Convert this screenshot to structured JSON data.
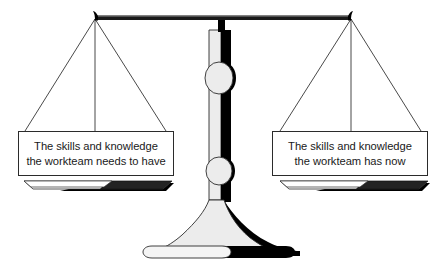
{
  "diagram": {
    "background_color": "#ffffff",
    "ink_color": "#000000",
    "shade_color": "#e8e8e8",
    "outline_color": "#2b2b2b",
    "beam_state": "balanced"
  },
  "left_pan": {
    "label_lines": [
      "The skills and knowledge",
      "the workteam needs to have"
    ]
  },
  "right_pan": {
    "label_lines": [
      "The skills and knowledge",
      "the workteam has now"
    ]
  }
}
